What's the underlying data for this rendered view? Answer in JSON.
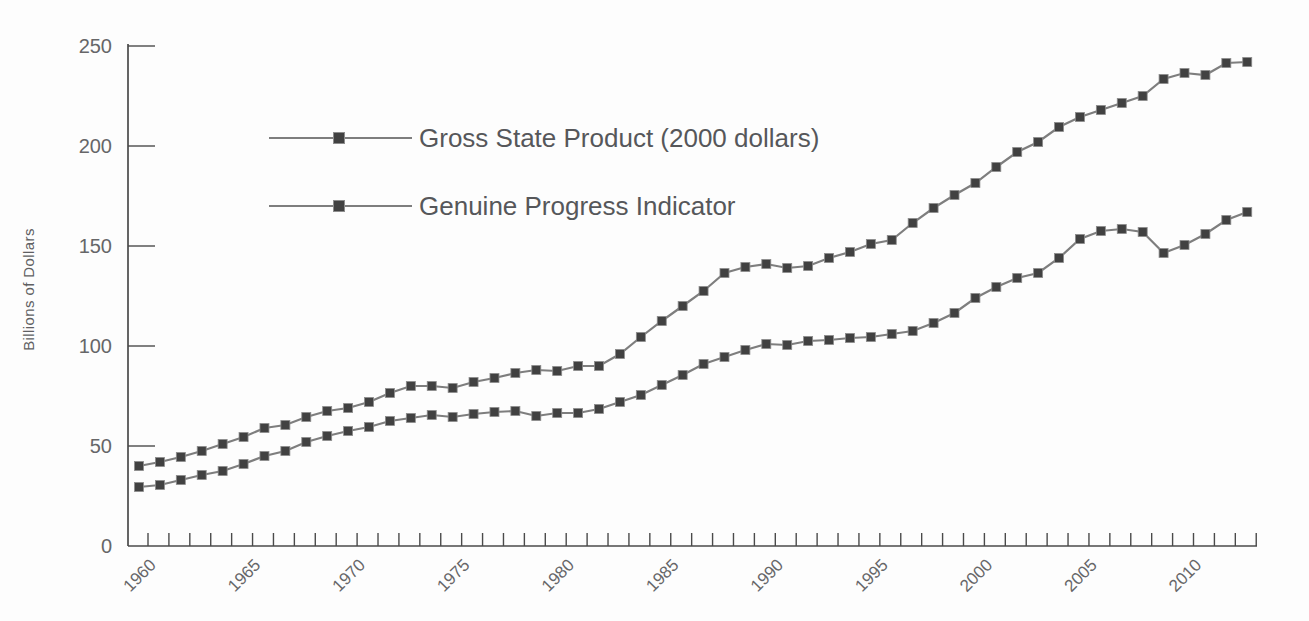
{
  "chart_data": {
    "type": "line",
    "title": "",
    "xlabel": "",
    "ylabel": "Billions of Dollars",
    "ylim": [
      0,
      250
    ],
    "yticks": [
      0,
      50,
      100,
      150,
      200,
      250
    ],
    "ytick_labels": [
      "0",
      "50",
      "100",
      "150",
      "200",
      "250"
    ],
    "xtick_years_labeled": [
      1960,
      1965,
      1970,
      1975,
      1980,
      1985,
      1990,
      1995,
      2000,
      2005,
      2010
    ],
    "x": [
      1960,
      1961,
      1962,
      1963,
      1964,
      1965,
      1966,
      1967,
      1968,
      1969,
      1970,
      1971,
      1972,
      1973,
      1974,
      1975,
      1976,
      1977,
      1978,
      1979,
      1980,
      1981,
      1982,
      1983,
      1984,
      1985,
      1986,
      1987,
      1988,
      1989,
      1990,
      1991,
      1992,
      1993,
      1994,
      1995,
      1996,
      1997,
      1998,
      1999,
      2000,
      2001,
      2002,
      2003,
      2004,
      2005,
      2006,
      2007,
      2008,
      2009,
      2010,
      2011,
      2012,
      2013
    ],
    "series": [
      {
        "name": "Gross State Product (2000 dollars)",
        "values": [
          40,
          42,
          44.5,
          47.5,
          51,
          54.5,
          59,
          60.5,
          64.5,
          67.5,
          69,
          72,
          76.5,
          80,
          80,
          79,
          82,
          84,
          86.5,
          88,
          87.5,
          90,
          90,
          96,
          104.5,
          112.5,
          120,
          127.5,
          136.5,
          139.5,
          141,
          139,
          140,
          144,
          147,
          151,
          153,
          161.5,
          169,
          175.5,
          181.5,
          189.5,
          197,
          202,
          209.5,
          214.5,
          218,
          221.5,
          225,
          233.5,
          236.5,
          235.5,
          241.5,
          242
        ]
      },
      {
        "name": "Genuine Progress Indicator",
        "values": [
          29.5,
          30.5,
          33,
          35.5,
          37.5,
          41,
          45,
          47.5,
          52,
          55,
          57.5,
          59.5,
          62.5,
          64,
          65.5,
          64.5,
          66,
          67,
          67.5,
          65,
          66.5,
          66.5,
          68.5,
          72,
          75.5,
          80.5,
          85.5,
          91,
          94.5,
          98,
          101,
          100.5,
          102.5,
          103,
          104,
          104.5,
          106,
          107.5,
          111.5,
          116.5,
          124,
          129.5,
          134,
          136.5,
          144,
          153.5,
          157.5,
          158.5,
          157,
          146.5,
          150.5,
          156,
          163,
          167
        ]
      }
    ],
    "legend_position": "upper-left-inside",
    "grid": false,
    "marker": "square",
    "colors": {
      "line": "#7e7e7e",
      "marker": "#414141",
      "axis": "#4a4a4a",
      "tick_text": "#666668",
      "legend_text": "#56575a"
    }
  }
}
